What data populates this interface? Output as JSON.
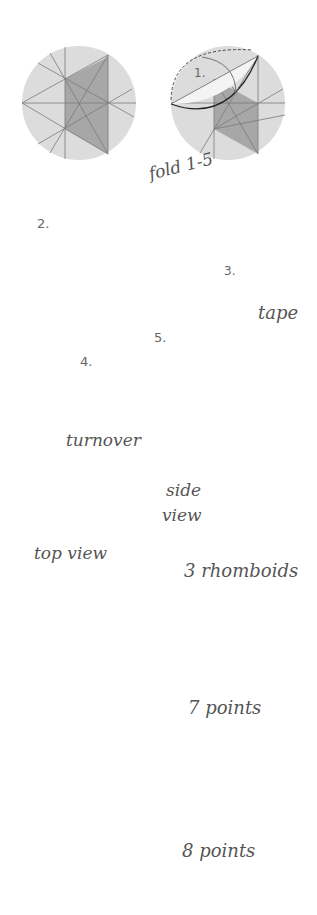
{
  "diagram": {
    "type": "origami-instructions",
    "colors": {
      "paper_light": "#dcdcdc",
      "paper_mid": "#b9b9b9",
      "paper_dark": "#7a7a7a",
      "paper_white": "#f6f6f6",
      "line": "#808080",
      "fold_edge": "#333333"
    },
    "labels": {
      "fold_range": "fold 1-5",
      "tape": "tape",
      "turnover": "turnover",
      "side_view": "side view",
      "side": "side",
      "view": "view",
      "three_rhomboids": "3 rhomboids",
      "top_view": "top view",
      "seven_points": "7 points",
      "eight_points": "8 points"
    },
    "steps": [
      {
        "number": "1.",
        "description": "fold circle segment along line"
      },
      {
        "number": "2.",
        "description": "fold left segment over"
      },
      {
        "number": "3.",
        "description": "fold lower corner up"
      },
      {
        "number": "4.",
        "description": "fold right segment back"
      },
      {
        "number": "5.",
        "description": "fold upper corner down"
      }
    ],
    "graphs": [
      {
        "label": "7 points",
        "hexagon_vertices": 6,
        "center_points": 1
      },
      {
        "label": "8 points",
        "hexagon_vertices": 6,
        "center_points": 2
      }
    ]
  }
}
